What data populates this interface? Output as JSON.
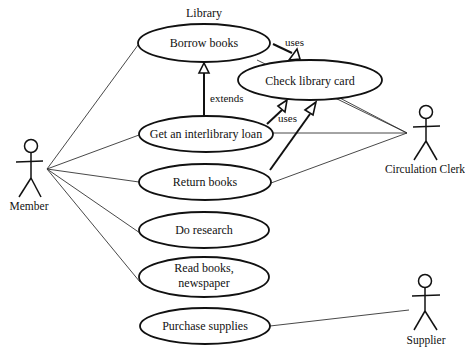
{
  "diagram": {
    "type": "UML use case diagram",
    "title": "Library",
    "colors": {
      "line": "#111111",
      "background": "#ffffff"
    },
    "actors": [
      {
        "id": "member",
        "label": "Member"
      },
      {
        "id": "clerk",
        "label": "Circulation Clerk"
      },
      {
        "id": "supplier",
        "label": "Supplier"
      }
    ],
    "use_cases": [
      {
        "id": "borrow",
        "label": "Borrow books"
      },
      {
        "id": "check",
        "label": "Check library card"
      },
      {
        "id": "interlibrary",
        "label": "Get an interlibrary loan"
      },
      {
        "id": "return",
        "label": "Return books"
      },
      {
        "id": "research",
        "label": "Do research"
      },
      {
        "id": "read_line1",
        "label": "Read books,"
      },
      {
        "id": "read_line2",
        "label": "newspaper"
      },
      {
        "id": "purchase",
        "label": "Purchase supplies"
      }
    ],
    "relationships": {
      "uses_1": "uses",
      "uses_2": "uses",
      "extends": "extends"
    },
    "associations": [
      [
        "Member",
        "Borrow books"
      ],
      [
        "Member",
        "Get an interlibrary loan"
      ],
      [
        "Member",
        "Return books"
      ],
      [
        "Member",
        "Do research"
      ],
      [
        "Member",
        "Read books, newspaper"
      ],
      [
        "Circulation Clerk",
        "Borrow books"
      ],
      [
        "Circulation Clerk",
        "Check library card"
      ],
      [
        "Circulation Clerk",
        "Get an interlibrary loan"
      ],
      [
        "Circulation Clerk",
        "Return books"
      ],
      [
        "Supplier",
        "Purchase supplies"
      ]
    ],
    "dependencies": [
      {
        "from": "Borrow books",
        "to": "Check library card",
        "label": "uses"
      },
      {
        "from": "Get an interlibrary loan",
        "to": "Check library card",
        "label": "uses"
      },
      {
        "from": "Return books",
        "to": "Check library card",
        "label": ""
      },
      {
        "from": "Get an interlibrary loan",
        "to": "Borrow books",
        "label": "extends"
      }
    ]
  }
}
